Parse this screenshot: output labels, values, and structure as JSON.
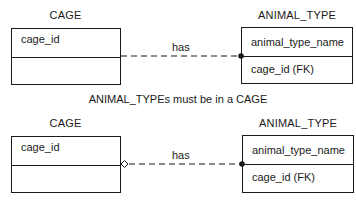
{
  "diagrams": [
    {
      "left_entity": {
        "title": "CAGE",
        "attributes": [
          "cage_id",
          ""
        ]
      },
      "right_entity": {
        "title": "ANIMAL_TYPE",
        "attributes": [
          "animal_type_name",
          "cage_id (FK)"
        ]
      },
      "relationship": {
        "label": "has",
        "left_end": "none",
        "right_end": "filled-dot",
        "line_style": "dashed"
      }
    },
    {
      "left_entity": {
        "title": "CAGE",
        "attributes": [
          "cage_id",
          ""
        ]
      },
      "right_entity": {
        "title": "ANIMAL_TYPE",
        "attributes": [
          "animal_type_name",
          "cage_id (FK)"
        ]
      },
      "relationship": {
        "label": "has",
        "left_end": "hollow-diamond",
        "right_end": "filled-dot",
        "line_style": "dashed"
      }
    }
  ],
  "caption": "ANIMAL_TYPEs must be in a CAGE",
  "colors": {
    "line": "#1a1a1a",
    "background": "#ffffff"
  }
}
